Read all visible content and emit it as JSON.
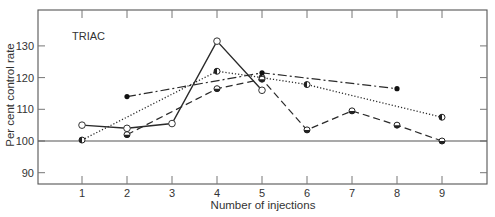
{
  "chart_data": {
    "type": "line",
    "title": "",
    "panel_label": "TRIAC",
    "xlabel": "Number of injections",
    "ylabel": "Per cent control rate",
    "x_ticks": [
      1,
      2,
      3,
      4,
      5,
      6,
      7,
      8,
      9
    ],
    "y_ticks": [
      90,
      100,
      110,
      120,
      130
    ],
    "xlim": [
      0,
      10
    ],
    "ylim": [
      86.5,
      142
    ],
    "reference_line": 100,
    "grid": false,
    "legend": "none",
    "series": [
      {
        "name": "solid",
        "line_style": "solid",
        "marker": "open-circle",
        "x": [
          1,
          2,
          3,
          4,
          5
        ],
        "values": [
          105,
          104,
          105.5,
          131.5,
          116
        ]
      },
      {
        "name": "dotted",
        "line_style": "dotted",
        "marker": "half-filled-circle-left",
        "x": [
          1,
          4,
          5,
          6,
          9
        ],
        "values": [
          100.3,
          122,
          120,
          117.8,
          107.5
        ]
      },
      {
        "name": "dash-dot",
        "line_style": "dash-dot",
        "marker": "filled-circle",
        "x": [
          2,
          5,
          8
        ],
        "values": [
          114,
          121.5,
          116.5
        ]
      },
      {
        "name": "dashed",
        "line_style": "dashed",
        "marker": "half-filled-circle-bottom",
        "x": [
          2,
          4,
          5,
          6,
          7,
          8,
          9
        ],
        "values": [
          102,
          116.5,
          119.5,
          103.5,
          109.5,
          105,
          100
        ]
      }
    ]
  }
}
